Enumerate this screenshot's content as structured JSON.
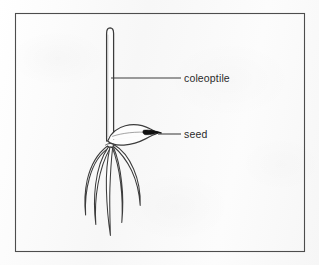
{
  "figure": {
    "type": "botanical-line-diagram",
    "background_color": "#fbfbfb",
    "ink_color": "#3a3a3a",
    "border": {
      "name": "figure-frame",
      "color": "#4a4a4a",
      "x": 15,
      "y": 13,
      "width": 290,
      "height": 239
    },
    "labels": [
      {
        "id": "coleoptile",
        "text": "coleoptile",
        "text_x": 184,
        "text_y": 82,
        "leader": {
          "x1": 111,
          "y1": 78,
          "x2": 181,
          "y2": 78
        }
      },
      {
        "id": "seed",
        "text": "seed",
        "text_x": 184,
        "text_y": 138,
        "leader": {
          "x1": 158,
          "y1": 134,
          "x2": 181,
          "y2": 134
        }
      }
    ],
    "parts": {
      "coleoptile": {
        "name": "coleoptile-shoot",
        "description": "narrow vertical tube with rounded apex",
        "top_y": 28,
        "bottom_y": 142,
        "center_x": 110,
        "width": 7
      },
      "seed": {
        "name": "seed-body",
        "description": "pointed lens-shaped grain with dark awn at tip",
        "left_x": 107,
        "right_x": 156,
        "center_y": 133,
        "awn_color": "#111111"
      },
      "roots": {
        "name": "root-system",
        "description": "five tapering seminal roots fanning downward",
        "count": 5,
        "origin_x": 110,
        "origin_y": 147,
        "tip_min_y": 212,
        "tip_max_y": 236
      }
    }
  }
}
